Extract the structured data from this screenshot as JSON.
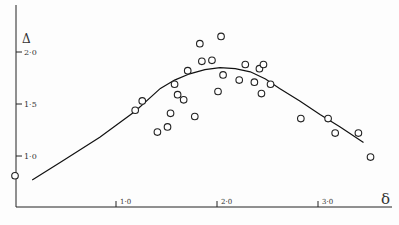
{
  "chart_data": {
    "type": "scatter",
    "title": "",
    "xlabel": "δ",
    "ylabel": "Δ",
    "xlim": [
      0,
      3.7
    ],
    "ylim": [
      0.7,
      2.3
    ],
    "grid": false,
    "legend": null,
    "x_ticks": [
      {
        "value": 1.0,
        "label": "1·0"
      },
      {
        "value": 2.0,
        "label": "2·0"
      },
      {
        "value": 3.0,
        "label": "3·0"
      }
    ],
    "y_ticks": [
      {
        "value": 1.0,
        "label": "1·0"
      },
      {
        "value": 1.5,
        "label": "1·5"
      },
      {
        "value": 2.0,
        "label": "2·0"
      }
    ],
    "series": [
      {
        "name": "observations",
        "kind": "scatter",
        "marker": "open-circle",
        "x": [
          0.0,
          1.19,
          1.26,
          1.41,
          1.51,
          1.54,
          1.58,
          1.61,
          1.67,
          1.71,
          1.78,
          1.83,
          1.85,
          1.95,
          2.01,
          2.04,
          2.06,
          2.22,
          2.28,
          2.37,
          2.42,
          2.46,
          2.44,
          2.53,
          2.83,
          3.1,
          3.17,
          3.4,
          3.52
        ],
        "y": [
          0.81,
          1.44,
          1.53,
          1.23,
          1.28,
          1.41,
          1.69,
          1.59,
          1.54,
          1.82,
          1.38,
          2.08,
          1.91,
          1.92,
          1.62,
          2.15,
          1.78,
          1.73,
          1.88,
          1.71,
          1.84,
          1.88,
          1.6,
          1.69,
          1.36,
          1.36,
          1.22,
          1.22,
          0.99
        ]
      },
      {
        "name": "fitted curve",
        "kind": "line",
        "x": [
          0.17,
          0.45,
          0.84,
          1.19,
          1.44,
          1.58,
          1.73,
          1.88,
          2.03,
          2.18,
          2.33,
          2.48,
          2.62,
          2.82,
          3.02,
          3.22,
          3.45
        ],
        "y": [
          0.77,
          0.94,
          1.18,
          1.43,
          1.65,
          1.73,
          1.79,
          1.83,
          1.85,
          1.84,
          1.81,
          1.74,
          1.65,
          1.53,
          1.4,
          1.28,
          1.13
        ]
      }
    ]
  },
  "axes": {
    "x_label": "δ",
    "y_label": "Δ",
    "x_tick_labels": [
      "1·0",
      "2·0",
      "3·0"
    ],
    "y_tick_labels": [
      "2·0",
      "1·5",
      "1·0"
    ]
  }
}
